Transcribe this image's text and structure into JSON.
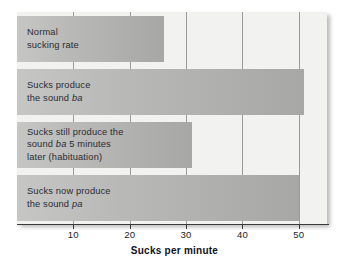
{
  "chart_data": {
    "type": "bar",
    "orientation": "horizontal",
    "title": "",
    "xlabel": "Sucks per minute",
    "ylabel": "",
    "xlim": [
      0,
      55
    ],
    "xticks": [
      10,
      20,
      30,
      40,
      50
    ],
    "xticklabels": [
      "10",
      "20",
      "30",
      "40",
      "50"
    ],
    "grid": "vertical",
    "legend": "none",
    "categories": [
      "Normal sucking rate",
      "Sucks produce the sound ba",
      "Sucks still produce the sound ba 5 minutes later (habituation)",
      "Sucks now produce the sound pa"
    ],
    "values": [
      26,
      51,
      31,
      50
    ],
    "bars": [
      {
        "value": 26,
        "label_lines": [
          [
            {
              "text": "Normal",
              "italic": false
            }
          ],
          [
            {
              "text": "sucking rate",
              "italic": false
            }
          ]
        ]
      },
      {
        "value": 51,
        "label_lines": [
          [
            {
              "text": "Sucks produce",
              "italic": false
            }
          ],
          [
            {
              "text": "the sound ",
              "italic": false
            },
            {
              "text": "ba",
              "italic": true
            }
          ]
        ]
      },
      {
        "value": 31,
        "label_lines": [
          [
            {
              "text": "Sucks still produce the",
              "italic": false
            }
          ],
          [
            {
              "text": "sound ",
              "italic": false
            },
            {
              "text": "ba",
              "italic": true
            },
            {
              "text": " 5 minutes",
              "italic": false
            }
          ],
          [
            {
              "text": "later (habituation)",
              "italic": false
            }
          ]
        ]
      },
      {
        "value": 50,
        "label_lines": [
          [
            {
              "text": "Sucks now produce",
              "italic": false
            }
          ],
          [
            {
              "text": "the sound ",
              "italic": false
            },
            {
              "text": "pa",
              "italic": true
            }
          ]
        ]
      }
    ],
    "colors": {
      "bar_fill_light": "#c6c6c4",
      "bar_fill_dark": "#a7a7a5",
      "panel_background": "#f2f2f0",
      "gridline": "#9a9a9a",
      "axis": "#3a3a3a",
      "text": "#1d1d26"
    }
  }
}
